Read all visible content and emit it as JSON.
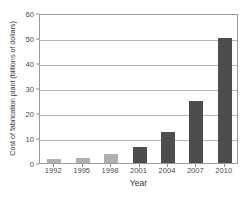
{
  "chart_data": {
    "type": "bar",
    "title": "",
    "xlabel": "Year",
    "ylabel": "Cost of fabrication plant (billions of dollars)",
    "categories": [
      "1992",
      "1995",
      "1998",
      "2001",
      "2004",
      "2007",
      "2010"
    ],
    "values": [
      1.5,
      2.2,
      3.5,
      6.5,
      12.5,
      25,
      50
    ],
    "bar_colors": [
      "#b0b0b0",
      "#b0b0b0",
      "#b0b0b0",
      "#4d4d4d",
      "#4d4d4d",
      "#4d4d4d",
      "#4d4d4d"
    ],
    "ylim": [
      0,
      60
    ],
    "yticks": [
      0,
      10,
      20,
      30,
      40,
      50,
      60
    ],
    "ytick_labels": [
      "0",
      "10",
      "20",
      "30",
      "40",
      "50",
      "60"
    ],
    "grid": true,
    "grid_axis": "y",
    "legend": null,
    "frame_color": "#9a9a9a",
    "grid_color": "#b5b5b5",
    "text_color": "#3a3a3a"
  }
}
